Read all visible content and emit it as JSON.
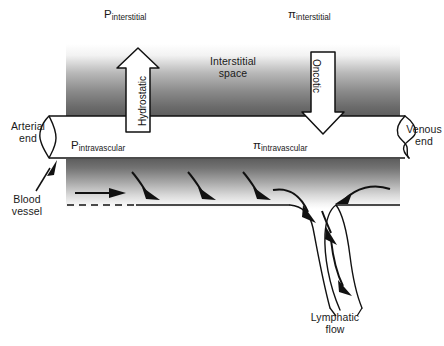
{
  "figure": {
    "background_color": "#ffffff",
    "ink_color": "#111111"
  },
  "labels": {
    "p_interstitial": {
      "symbol": "P",
      "subscript": "interstitial"
    },
    "pi_interstitial": {
      "symbol": "π",
      "subscript": "interstitial"
    },
    "p_intravascular": {
      "symbol": "P",
      "subscript": "intravascular"
    },
    "pi_intravascular": {
      "symbol": "π",
      "subscript": "intravascular"
    },
    "interstitial_space": "Interstitial\nspace",
    "interstitial_space_line1": "Interstitial",
    "interstitial_space_line2": "space",
    "arterial_end_line1": "Arterial",
    "arterial_end_line2": "end",
    "venous_end_line1": "Venous",
    "venous_end_line2": "end",
    "blood_vessel_line1": "Blood",
    "blood_vessel_line2": "vessel",
    "lymphatic_flow_line1": "Lymphatic",
    "lymphatic_flow_line2": "flow"
  },
  "arrows": {
    "hydrostatic": {
      "label": "Hydrostatic",
      "direction": "up",
      "meaning": "hydrostatic pressure pushes fluid out of the vessel"
    },
    "oncotic": {
      "label": "Oncotic",
      "direction": "down",
      "meaning": "oncotic pressure pulls fluid into the vessel"
    },
    "flow_arrows_count": 4,
    "lymph_arrows_count": 4
  },
  "regions": {
    "upper_interstitium": {
      "name": "upper interstitial shading",
      "gradient": "white to dark gray, top to bottom",
      "top_color": "#ffffff",
      "bottom_color": "#5a5a5a"
    },
    "lower_interstitium": {
      "name": "lower interstitial shading",
      "gradient": "dark gray to white, top to bottom",
      "top_color": "#5a5a5a",
      "bottom_color": "#ffffff"
    },
    "vessel_lumen": {
      "name": "blood vessel lumen",
      "fill": "#ffffff",
      "stroke": "#111111"
    }
  }
}
